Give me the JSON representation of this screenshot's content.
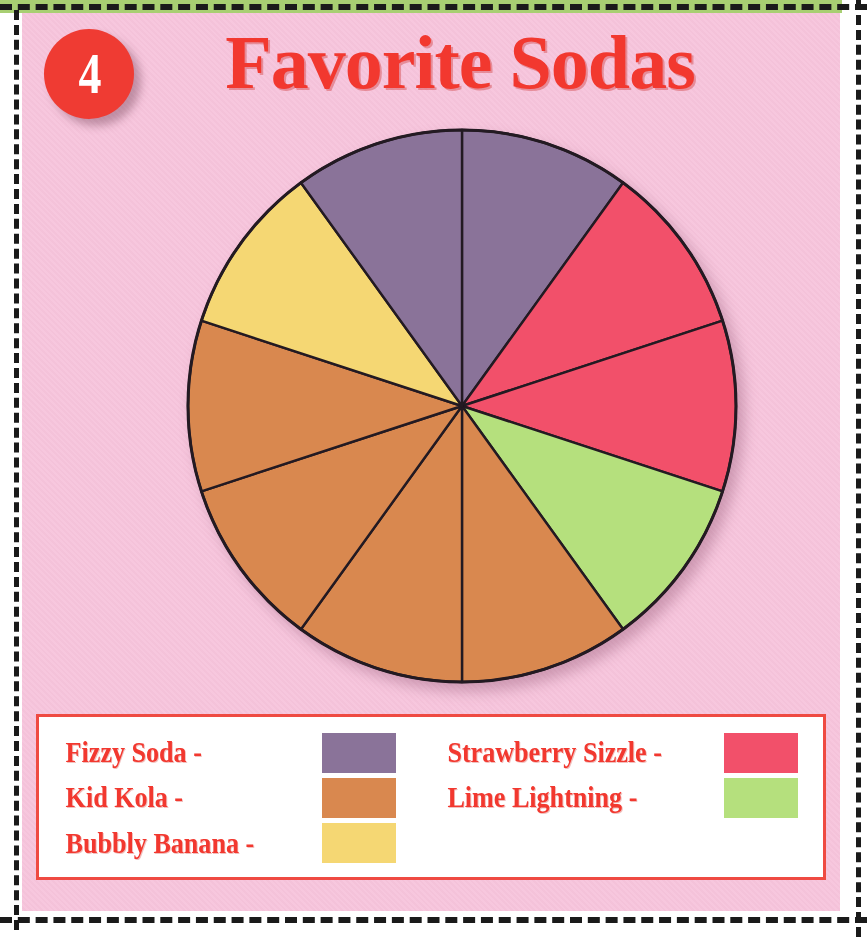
{
  "page": {
    "exercise_number": "4",
    "title": "Favorite Sodas",
    "background_color": "#f7c4dc",
    "accent_color": "#f2382f",
    "trim_strip_color": "#a8cf72"
  },
  "legend": {
    "left_column": [
      {
        "label": "Fizzy Soda -",
        "color": "#8a7399"
      },
      {
        "label": "Kid Kola -",
        "color": "#d9884f"
      },
      {
        "label": "Bubbly Banana -",
        "color": "#f5d773"
      }
    ],
    "right_column": [
      {
        "label": "Strawberry Sizzle -",
        "color": "#f2506a"
      },
      {
        "label": "Lime Lightning -",
        "color": "#b5e07d"
      }
    ]
  },
  "chart_data": {
    "type": "pie",
    "title": "Favorite Sodas",
    "total_slices": 10,
    "slice_angle_degrees": 36,
    "start_angle_degrees": 0,
    "direction": "clockwise",
    "legend_position": "bottom",
    "grid": false,
    "categories": [
      "Fizzy Soda",
      "Strawberry Sizzle",
      "Lime Lightning",
      "Kid Kola",
      "Bubbly Banana"
    ],
    "values": [
      2,
      2,
      1,
      4,
      1
    ],
    "colors": [
      "#8a7399",
      "#f2506a",
      "#b5e07d",
      "#d9884f",
      "#f5d773"
    ],
    "slices": [
      {
        "index": 1,
        "category": "Fizzy Soda",
        "color": "#8a7399",
        "start_deg": 0,
        "end_deg": 36
      },
      {
        "index": 2,
        "category": "Strawberry Sizzle",
        "color": "#f2506a",
        "start_deg": 36,
        "end_deg": 72
      },
      {
        "index": 3,
        "category": "Strawberry Sizzle",
        "color": "#f2506a",
        "start_deg": 72,
        "end_deg": 108
      },
      {
        "index": 4,
        "category": "Lime Lightning",
        "color": "#b5e07d",
        "start_deg": 108,
        "end_deg": 144
      },
      {
        "index": 5,
        "category": "Kid Kola",
        "color": "#d9884f",
        "start_deg": 144,
        "end_deg": 180
      },
      {
        "index": 6,
        "category": "Kid Kola",
        "color": "#d9884f",
        "start_deg": 180,
        "end_deg": 216
      },
      {
        "index": 7,
        "category": "Kid Kola",
        "color": "#d9884f",
        "start_deg": 216,
        "end_deg": 252
      },
      {
        "index": 8,
        "category": "Kid Kola",
        "color": "#d9884f",
        "start_deg": 252,
        "end_deg": 288
      },
      {
        "index": 9,
        "category": "Bubbly Banana",
        "color": "#f5d773",
        "start_deg": 288,
        "end_deg": 324
      },
      {
        "index": 10,
        "category": "Fizzy Soda",
        "color": "#8a7399",
        "start_deg": 324,
        "end_deg": 360
      }
    ]
  }
}
